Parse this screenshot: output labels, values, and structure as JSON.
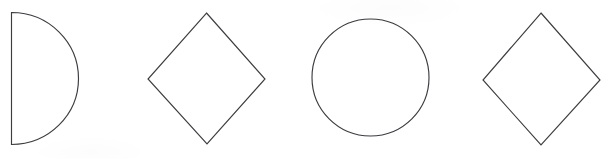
{
  "canvas": {
    "width": 611,
    "height": 159,
    "background_color": "#ffffff",
    "stroke_color": "#3c3c41",
    "stroke_width": 1.15,
    "description": "Row of four outlined geometric shapes on a plain white scanned background"
  },
  "shapes": [
    {
      "index": 1,
      "name": "half-circle",
      "label": "Half circle",
      "geometry": "semicircle opening left, flat vertical edge on the left side",
      "flat_edge_x": 11,
      "top_y": 12,
      "bottom_y": 145,
      "arc_rightmost_x": 78,
      "center_x": 11,
      "center_y": 78.5,
      "radius": 67,
      "path": "M 11.5 12.5 L 11.5 144.5 A 67 66 0 0 0 11.5 12.5 Z"
    },
    {
      "index": 2,
      "name": "diamond-left",
      "label": "Diamond",
      "geometry": "square rotated 45 degrees",
      "top_vertex": [
        206,
        13
      ],
      "right_vertex": [
        265,
        79
      ],
      "bottom_vertex": [
        207,
        144
      ],
      "left_vertex": [
        148,
        79
      ],
      "path": "M 206.5 13 L 265 79 L 207 144 L 148 79 Z"
    },
    {
      "index": 3,
      "name": "circle",
      "label": "Circle",
      "geometry": "full circle outline",
      "center_x": 370.5,
      "center_y": 77.5,
      "radius_x": 58.5,
      "radius_y": 58.5,
      "left_x": 312,
      "right_x": 429,
      "top_y": 19,
      "bottom_y": 136
    },
    {
      "index": 4,
      "name": "diamond-right",
      "label": "Diamond",
      "geometry": "square rotated 45 degrees",
      "top_vertex": [
        541,
        13
      ],
      "right_vertex": [
        600,
        80
      ],
      "bottom_vertex": [
        541,
        145
      ],
      "left_vertex": [
        483,
        80
      ],
      "path": "M 541 13 L 600 80 L 541 145 L 483 80 Z"
    }
  ]
}
